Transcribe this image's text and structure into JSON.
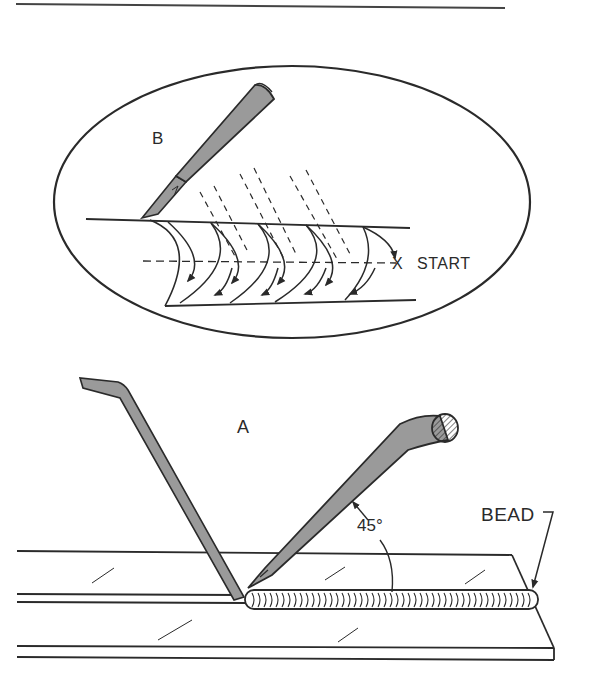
{
  "figure": {
    "type": "technical illustration",
    "palette": {
      "line": "#2a2a2a",
      "electrode_fill": "#9a9a9a",
      "background": "#ffffff"
    }
  },
  "inset": {
    "label": "B",
    "start_marker": "X",
    "start_label": "START"
  },
  "main_view": {
    "label": "A",
    "angle_label": "45°",
    "bead_label": "BEAD"
  }
}
